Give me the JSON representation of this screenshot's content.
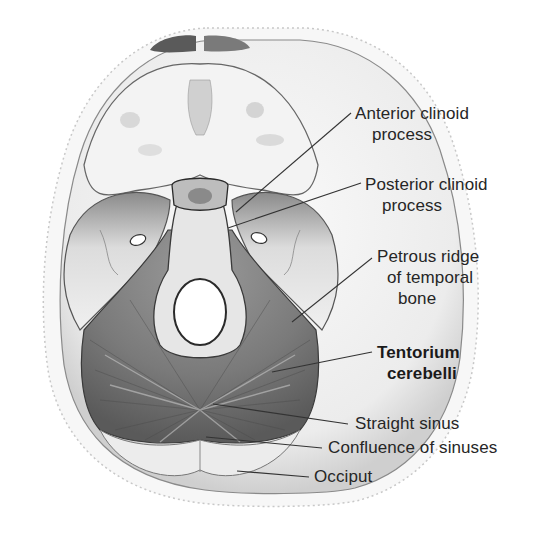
{
  "figure": {
    "colors": {
      "background": "#ffffff",
      "bone": "#f2f2f2",
      "bone_shade": "#b5b5b5",
      "tentorium": "#6e6e6e",
      "label_text": "#262626",
      "leader_line": "#333333"
    }
  },
  "labels": [
    {
      "id": "anterior-clinoid",
      "line1": "Anterior clinoid",
      "line2": "process",
      "bold": false
    },
    {
      "id": "posterior-clinoid",
      "line1": "Posterior clinoid",
      "line2": "process",
      "bold": false
    },
    {
      "id": "petrous-ridge",
      "line1": "Petrous ridge",
      "line2": "of temporal",
      "line3": "bone",
      "bold": false
    },
    {
      "id": "tentorium",
      "line1": "Tentorium",
      "line2": "cerebelli",
      "bold": true
    },
    {
      "id": "straight-sinus",
      "line1": "Straight sinus",
      "bold": false
    },
    {
      "id": "confluence",
      "line1": "Confluence of sinuses",
      "bold": false
    },
    {
      "id": "occiput",
      "line1": "Occiput",
      "bold": false
    }
  ]
}
